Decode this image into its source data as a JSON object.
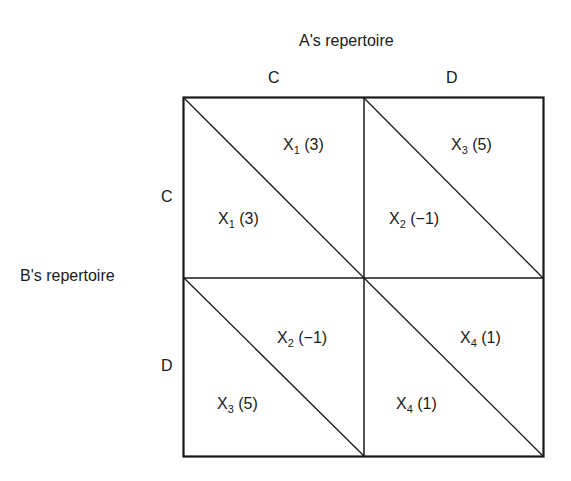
{
  "title_top": "A's repertoire",
  "title_left": "B's repertoire",
  "columns": [
    {
      "label": "C"
    },
    {
      "label": "D"
    }
  ],
  "rows": [
    {
      "label": "C"
    },
    {
      "label": "D"
    }
  ],
  "cells": {
    "CC": {
      "upper": {
        "var": "X",
        "sub": "1",
        "val": "(3)"
      },
      "lower": {
        "var": "X",
        "sub": "1",
        "val": "(3)"
      }
    },
    "CD": {
      "upper": {
        "var": "X",
        "sub": "3",
        "val": "(5)"
      },
      "lower": {
        "var": "X",
        "sub": "2",
        "val": "(−1)"
      }
    },
    "DC": {
      "upper": {
        "var": "X",
        "sub": "2",
        "val": "(−1)"
      },
      "lower": {
        "var": "X",
        "sub": "3",
        "val": "(5)"
      }
    },
    "DD": {
      "upper": {
        "var": "X",
        "sub": "4",
        "val": "(1)"
      },
      "lower": {
        "var": "X",
        "sub": "4",
        "val": "(1)"
      }
    }
  },
  "colors": {
    "line": "#1a1a1a",
    "background": "#ffffff"
  }
}
